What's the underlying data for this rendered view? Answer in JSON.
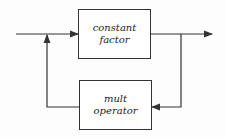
{
  "diagram": {
    "blocks": [
      {
        "id": "constant-factor",
        "lines": [
          "constant",
          "factor"
        ]
      },
      {
        "id": "mult-operator",
        "lines": [
          "mult",
          "operator"
        ]
      }
    ],
    "edges": [
      {
        "from": "input",
        "to": "constant-factor"
      },
      {
        "from": "constant-factor",
        "to": "output"
      },
      {
        "from": "constant-factor",
        "to": "mult-operator",
        "type": "feedback"
      },
      {
        "from": "mult-operator",
        "to": "input-junction",
        "type": "feedback"
      }
    ],
    "colors": {
      "line": "#333333",
      "background": "#ffffff"
    }
  }
}
